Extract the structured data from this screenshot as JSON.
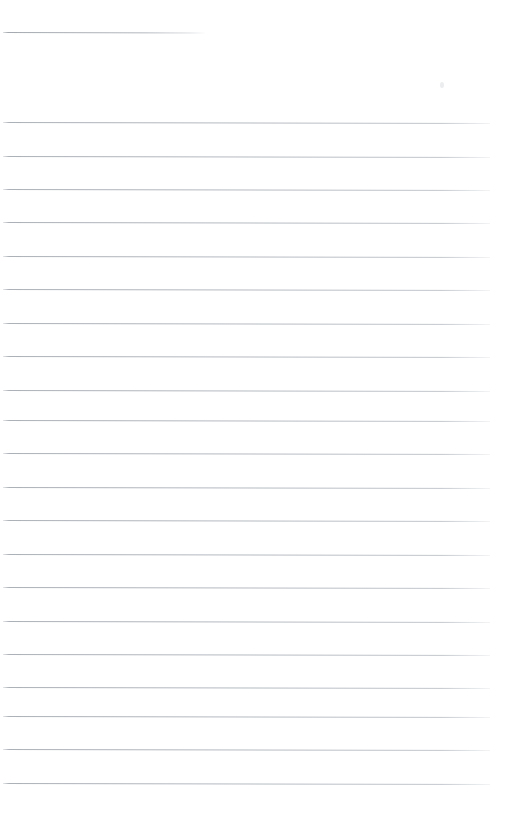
{
  "document": {
    "kind": "scanned-lined-paper",
    "title": "",
    "background_color": "#ffffff",
    "page_width": 506,
    "page_height": 830
  },
  "ruling": {
    "line_color": "#a8adb4",
    "line_thickness_px": 1,
    "skew_degrees": 0.12,
    "body_line_count": 20,
    "body_first_line_y": 122,
    "body_line_spacing_px": 33.5,
    "body_line_left_x": 3,
    "body_line_right_x": 490,
    "header_rule": {
      "label": "header-rule",
      "y": 32,
      "left_x": 3,
      "right_x": 205,
      "width": 202
    },
    "body_lines": [
      {
        "index": 1,
        "y": 122
      },
      {
        "index": 2,
        "y": 156
      },
      {
        "index": 3,
        "y": 189
      },
      {
        "index": 4,
        "y": 222
      },
      {
        "index": 5,
        "y": 256
      },
      {
        "index": 6,
        "y": 289
      },
      {
        "index": 7,
        "y": 323
      },
      {
        "index": 8,
        "y": 356
      },
      {
        "index": 9,
        "y": 390
      },
      {
        "index": 10,
        "y": 420
      },
      {
        "index": 11,
        "y": 453
      },
      {
        "index": 12,
        "y": 487
      },
      {
        "index": 13,
        "y": 520
      },
      {
        "index": 14,
        "y": 554
      },
      {
        "index": 15,
        "y": 587
      },
      {
        "index": 16,
        "y": 621
      },
      {
        "index": 17,
        "y": 654
      },
      {
        "index": 18,
        "y": 687
      },
      {
        "index": 19,
        "y": 716
      },
      {
        "index": 20,
        "y": 749
      },
      {
        "index": 21,
        "y": 783
      }
    ]
  },
  "artifacts": [
    {
      "name": "scan-speck",
      "x": 440,
      "y": 82
    }
  ],
  "content": {
    "written_text": "",
    "note": ""
  }
}
